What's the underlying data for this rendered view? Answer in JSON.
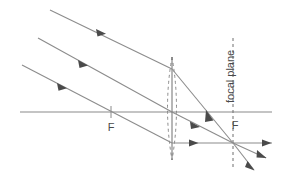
{
  "figure": {
    "background_color": "#ffffff",
    "ray_color": "#8c8c8c",
    "axis_color": "#8a8a8a",
    "arrow_color": "#4a4a4a",
    "lens_color": "#8a8a8a",
    "dash_color": "#6e6e6e",
    "label_color": "#4a4a4a"
  },
  "labels": {
    "focal_plane": "focal plane",
    "focal_point_left": "F",
    "focal_point_right": "F"
  },
  "optics": {
    "optical_axis": {
      "y": 112,
      "x_start": 20,
      "x_end": 272
    },
    "lens": {
      "center_x": 172,
      "top_y": 57,
      "bottom_y": 160,
      "half_width": 9,
      "style": "dashed-biconvex"
    },
    "focal_plane_line": {
      "x": 233,
      "top_y": 38,
      "bottom_y": 168,
      "style": "dashed"
    },
    "focal_points": [
      {
        "name": "F-left",
        "x": 111,
        "y": 112
      },
      {
        "name": "F-right",
        "x": 233,
        "y": 112
      }
    ],
    "focus_image_point": {
      "x": 233,
      "y": 143
    },
    "incoming_rays": [
      {
        "name": "ray-top",
        "x1": 50,
        "y1": 10,
        "x2": 172,
        "y2": 69,
        "arrow_t": 0.42
      },
      {
        "name": "ray-middle",
        "x1": 38,
        "y1": 38,
        "x2": 172,
        "y2": 112,
        "arrow_t": 0.4
      },
      {
        "name": "ray-bottom",
        "x1": 22,
        "y1": 65,
        "x2": 172,
        "y2": 143,
        "arrow_t": 0.36
      }
    ],
    "refracted_rays": [
      {
        "name": "refracted-top",
        "x1": 172,
        "y1": 69,
        "x2": 233,
        "y2": 143,
        "arrow_t": 0.62
      },
      {
        "name": "refracted-middle",
        "x1": 172,
        "y1": 112,
        "x2": 233,
        "y2": 143,
        "arrow_t": 0.58
      },
      {
        "name": "refracted-bottom",
        "x1": 172,
        "y1": 143,
        "x2": 233,
        "y2": 143,
        "arrow_t": 0.4
      }
    ],
    "outgoing_rays": [
      {
        "name": "outgoing-upper",
        "x1": 233,
        "y1": 143,
        "x2": 272,
        "y2": 143
      },
      {
        "name": "outgoing-middle",
        "x1": 233,
        "y1": 143,
        "x2": 268,
        "y2": 159
      },
      {
        "name": "outgoing-lower",
        "x1": 233,
        "y1": 143,
        "x2": 255,
        "y2": 172
      }
    ],
    "continued_rays": [
      {
        "name": "continued-middle",
        "x1": 233,
        "y1": 143,
        "x2": 262,
        "y2": 158
      }
    ]
  }
}
